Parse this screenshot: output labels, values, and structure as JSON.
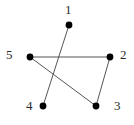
{
  "figure": {
    "name": "undirected-graph-5-vertices",
    "background_color": "#ffffff",
    "edge_color": "#555555",
    "vertex_color": "#000000",
    "label_color": "#2b2b2b",
    "vertex_radius": 3.4,
    "edge_width": 1
  },
  "chart_data": {
    "type": "diagram",
    "title": "",
    "xlabel": "",
    "ylabel": "",
    "graph_kind": "undirected-graph",
    "vertex_count": 5,
    "edge_count": 4,
    "vertices": [
      {
        "id": "1",
        "label": "1",
        "cx": 69,
        "cy": 25,
        "label_x": 65,
        "label_y": 3
      },
      {
        "id": "2",
        "label": "2",
        "cx": 110,
        "cy": 57,
        "label_x": 120,
        "label_y": 48
      },
      {
        "id": "3",
        "label": "3",
        "cx": 96,
        "cy": 106,
        "label_x": 114,
        "label_y": 99
      },
      {
        "id": "4",
        "label": "4",
        "cx": 43,
        "cy": 106,
        "label_x": 26,
        "label_y": 99
      },
      {
        "id": "5",
        "label": "5",
        "cx": 30,
        "cy": 57,
        "label_x": 6,
        "label_y": 48
      }
    ],
    "edges": [
      {
        "id": "edge-5-2",
        "from": "5",
        "to": "2",
        "x1": 30,
        "y1": 57,
        "x2": 110,
        "y2": 57
      },
      {
        "id": "edge-5-3",
        "from": "5",
        "to": "3",
        "x1": 30,
        "y1": 57,
        "x2": 96,
        "y2": 106
      },
      {
        "id": "edge-2-3",
        "from": "2",
        "to": "3",
        "x1": 110,
        "y1": 57,
        "x2": 96,
        "y2": 106
      },
      {
        "id": "edge-1-4",
        "from": "1",
        "to": "4",
        "x1": 69,
        "y1": 25,
        "x2": 43,
        "y2": 106
      }
    ],
    "labels": [
      "1",
      "2",
      "3",
      "4",
      "5"
    ]
  }
}
